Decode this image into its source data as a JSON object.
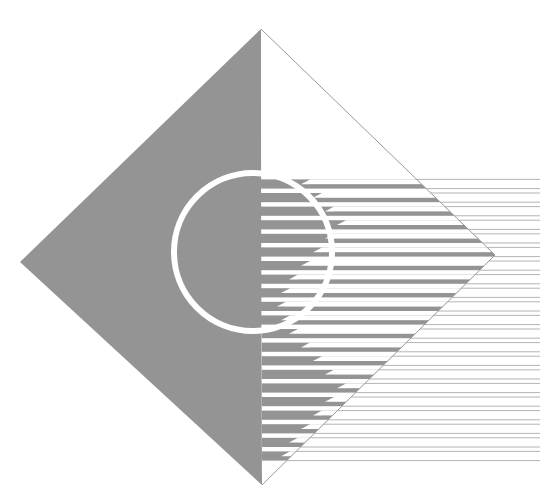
{
  "canvas": {
    "width": 540,
    "height": 504,
    "background_color": "#ffffff",
    "title": "Abstract Geometric Logo Artwork"
  },
  "palette": {
    "gray_fill": "#949494",
    "gray_fill_dark": "#8d8d8d",
    "hairline": "#b4b4b4",
    "outline": "#9a9a9a",
    "white": "#ffffff"
  },
  "shapes": {
    "diamond": {
      "name": "rotated-square-diamond",
      "top": [
        261,
        29
      ],
      "left": [
        20,
        262
      ],
      "right": [
        495,
        255
      ],
      "bottom": [
        262,
        485
      ],
      "left_half_fill": "#949494",
      "right_half_fill": "#ffffff",
      "right_half_stroke": "#9a9a9a",
      "stroke_width": 1
    },
    "circle": {
      "name": "striped-disc",
      "center_x": 253,
      "center_y": 252,
      "radius": 79,
      "ring_color": "#ffffff",
      "ring_width": 6
    }
  },
  "stripes": {
    "count": 21,
    "pitch": 13.6,
    "band_thickness": 9.2,
    "gap_thickness": 4.4,
    "first_center_y": 184,
    "band_color": "#949494",
    "gap_color": "#ffffff",
    "hairline_color": "#b4b4b4",
    "hairline_width": 1,
    "staircase_note": "white gap notches begin at varying x forming a stair stepping outward then back",
    "notch_x": [
      310,
      322,
      334,
      346,
      334,
      322,
      310,
      298,
      290,
      286,
      290,
      298,
      310,
      322,
      334,
      346,
      334,
      322,
      310,
      298,
      290
    ],
    "band_right_edge": 540,
    "diamond_right_edge_x": 495
  },
  "meta": {
    "domain": "abstract-vector-artwork",
    "element_label": "logo-artwork"
  }
}
